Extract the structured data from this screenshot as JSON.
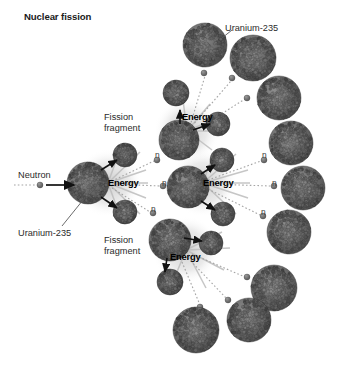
{
  "figure": {
    "title": "Nuclear fission",
    "background_color": "#ffffff",
    "nucleus_color": "#6b6b6b",
    "nucleus_dark_color": "#4a4a4a",
    "burst_color": "#b8b8b8",
    "text_color": "#2b2b2b",
    "title_color": "#1a1a1a"
  },
  "labels": {
    "title": "Nuclear fission",
    "neutron": "Neutron",
    "uranium_left": "Uranium-235",
    "uranium_top_right": "Uranium-235",
    "fission_fragment_top": "Fission\nfragment",
    "fission_fragment_top_line1": "Fission",
    "fission_fragment_top_line2": "fragment",
    "fission_fragment_bottom_line1": "Fission",
    "fission_fragment_bottom_line2": "fragment",
    "energy_left": "Energy",
    "energy_upper": "Energy",
    "energy_right": "Energy",
    "energy_lower": "Energy",
    "neutron_marker": "n"
  },
  "energy_bursts": [
    {
      "id": "energy-left",
      "label": "Energy",
      "x": 108,
      "y": 177
    },
    {
      "id": "energy-upper",
      "label": "Energy",
      "x": 177,
      "y": 117
    },
    {
      "id": "energy-right",
      "label": "Energy",
      "x": 203,
      "y": 177
    },
    {
      "id": "energy-lower",
      "label": "Energy",
      "x": 168,
      "y": 258
    }
  ],
  "neutron_markers": [
    {
      "id": "n-1",
      "label": "n",
      "x": 155,
      "y": 150
    },
    {
      "id": "n-2",
      "label": "n",
      "x": 162,
      "y": 178
    },
    {
      "id": "n-3",
      "label": "n",
      "x": 151,
      "y": 204
    },
    {
      "id": "n-4",
      "label": "n",
      "x": 262,
      "y": 150
    },
    {
      "id": "n-5",
      "label": "n",
      "x": 272,
      "y": 178
    },
    {
      "id": "n-6",
      "label": "n",
      "x": 261,
      "y": 207
    }
  ],
  "nuclei": [
    {
      "id": "u-target-left",
      "cx": 88,
      "cy": 183,
      "r": 21,
      "role": "fissioning-nucleus"
    },
    {
      "id": "frag-top-left",
      "cx": 125,
      "cy": 155,
      "r": 12,
      "role": "fission-fragment"
    },
    {
      "id": "frag-bottom-left",
      "cx": 125,
      "cy": 212,
      "r": 12,
      "role": "fission-fragment"
    },
    {
      "id": "u-upper-mid",
      "cx": 179,
      "cy": 140,
      "r": 20,
      "role": "fissioning-nucleus"
    },
    {
      "id": "frag-upper-a",
      "cx": 176,
      "cy": 93,
      "r": 13,
      "role": "fission-fragment"
    },
    {
      "id": "frag-upper-b",
      "cx": 218,
      "cy": 124,
      "r": 12,
      "role": "fission-fragment"
    },
    {
      "id": "u-right-mid",
      "cx": 188,
      "cy": 187,
      "r": 21,
      "role": "fissioning-nucleus"
    },
    {
      "id": "frag-right-a",
      "cx": 222,
      "cy": 160,
      "r": 12,
      "role": "fission-fragment"
    },
    {
      "id": "frag-right-b",
      "cx": 223,
      "cy": 214,
      "r": 12,
      "role": "fission-fragment"
    },
    {
      "id": "u-lower-mid",
      "cx": 170,
      "cy": 240,
      "r": 21,
      "role": "fissioning-nucleus"
    },
    {
      "id": "frag-lower-a",
      "cx": 211,
      "cy": 243,
      "r": 12,
      "role": "fission-fragment"
    },
    {
      "id": "frag-lower-b",
      "cx": 170,
      "cy": 282,
      "r": 13,
      "role": "fission-fragment"
    },
    {
      "id": "u-top-1",
      "cx": 205,
      "cy": 45,
      "r": 22,
      "role": "uranium-235"
    },
    {
      "id": "u-top-2",
      "cx": 253,
      "cy": 58,
      "r": 23,
      "role": "uranium-235"
    },
    {
      "id": "u-top-3",
      "cx": 279,
      "cy": 98,
      "r": 22,
      "role": "uranium-235"
    },
    {
      "id": "u-right-1",
      "cx": 291,
      "cy": 143,
      "r": 22,
      "role": "uranium-235"
    },
    {
      "id": "u-right-2",
      "cx": 303,
      "cy": 188,
      "r": 22,
      "role": "uranium-235"
    },
    {
      "id": "u-right-3",
      "cx": 289,
      "cy": 232,
      "r": 22,
      "role": "uranium-235"
    },
    {
      "id": "u-bottom-1",
      "cx": 274,
      "cy": 288,
      "r": 23,
      "role": "uranium-235"
    },
    {
      "id": "u-bottom-2",
      "cx": 196,
      "cy": 330,
      "r": 23,
      "role": "uranium-235"
    },
    {
      "id": "u-bottom-3",
      "cx": 249,
      "cy": 320,
      "r": 22,
      "role": "uranium-235"
    }
  ],
  "free_neutrons": [
    {
      "id": "fn-in",
      "cx": 40,
      "cy": 185,
      "r": 3
    },
    {
      "id": "fn-a",
      "cx": 204,
      "cy": 73,
      "r": 3
    },
    {
      "id": "fn-b",
      "cx": 232,
      "cy": 78,
      "r": 3
    },
    {
      "id": "fn-c",
      "cx": 247,
      "cy": 98,
      "r": 3
    },
    {
      "id": "fn-d",
      "cx": 157,
      "cy": 160,
      "r": 3
    },
    {
      "id": "fn-e",
      "cx": 163,
      "cy": 186,
      "r": 3
    },
    {
      "id": "fn-f",
      "cx": 153,
      "cy": 213,
      "r": 3
    },
    {
      "id": "fn-g",
      "cx": 264,
      "cy": 160,
      "r": 3
    },
    {
      "id": "fn-h",
      "cx": 274,
      "cy": 186,
      "r": 3
    },
    {
      "id": "fn-i",
      "cx": 263,
      "cy": 216,
      "r": 3
    },
    {
      "id": "fn-j",
      "cx": 247,
      "cy": 277,
      "r": 3
    },
    {
      "id": "fn-k",
      "cx": 228,
      "cy": 300,
      "r": 3
    },
    {
      "id": "fn-l",
      "cx": 200,
      "cy": 307,
      "r": 3
    }
  ],
  "arrows": {
    "incoming_neutron": {
      "x1": 46,
      "y1": 185,
      "x2": 72,
      "y2": 185
    },
    "leader_uranium_left": {
      "x1": 62,
      "y1": 228,
      "x2": 82,
      "y2": 203
    },
    "leader_uranium_top_right": {
      "x1": 230,
      "y1": 33,
      "x2": 222,
      "y2": 38
    }
  }
}
